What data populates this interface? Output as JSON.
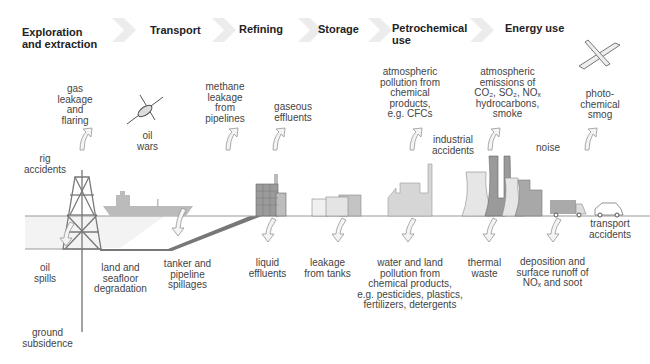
{
  "stages": [
    {
      "label": "Exploration\nand extraction"
    },
    {
      "label": "Transport"
    },
    {
      "label": "Refining"
    },
    {
      "label": "Storage"
    },
    {
      "label": "Petrochemical\nuse"
    },
    {
      "label": "Energy use"
    }
  ],
  "above_ground": {
    "gas_leakage": "gas\nleakage\nand\nflaring",
    "oil_wars": "oil\nwars",
    "methane": "methane\nleakage\nfrom\npipelines",
    "gaseous": "gaseous\neffluents",
    "atmos_chem": "atmospheric\npollution from\nchemical\nproducts,\ne.g. CFCs",
    "atmos_emissions": "atmospheric\nemissions of\nCO₂, SO₂, NOₓ\nhydrocarbons,\nsmoke",
    "photochem": "photo-\nchemical\nsmog",
    "rig_accidents": "rig\naccidents",
    "industrial_accidents": "industrial\naccidents",
    "noise": "noise",
    "transport_accidents": "transport\naccidents"
  },
  "below_ground": {
    "oil_spills": "oil\nspills",
    "land_seafloor": "land and\nseafloor\ndegradation",
    "tanker": "tanker and\npipeline\nspillages",
    "liquid": "liquid\neffluents",
    "leakage_tanks": "leakage\nfrom tanks",
    "water_land": "water and land\npollution from\nchemical products,\ne.g. pesticides, plastics,\nfertilizers, detergents",
    "thermal": "thermal\nwaste",
    "deposition": "deposition and\nsurface runoff of\nNOₓ and soot",
    "subsidence": "ground\nsubsidence"
  },
  "colors": {
    "stage_arrow": "#ececec",
    "fill_light": "#e2e2e2",
    "fill_mid": "#bdbdbd",
    "fill_dark": "#9a9a9a",
    "line": "#555555"
  }
}
